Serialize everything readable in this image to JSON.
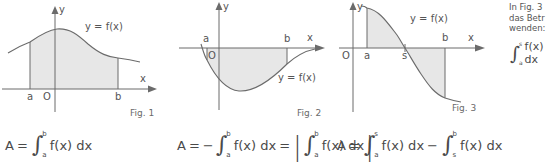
{
  "figures": [
    {
      "id": "fig1",
      "caption": "Fig. 1",
      "curve_label": "y = f(x)",
      "axis_x": "x",
      "axis_y": "y",
      "origin": "O",
      "lower_bound": "a",
      "upper_bound": "b",
      "fill_color": "#e7e7e7",
      "line_color": "#6b6b6b"
    },
    {
      "id": "fig2",
      "caption": "Fig. 2",
      "curve_label": "y = f(x)",
      "axis_x": "x",
      "axis_y": "y",
      "origin": "O",
      "lower_bound": "a",
      "upper_bound": "b",
      "fill_color": "#e7e7e7",
      "line_color": "#6b6b6b"
    },
    {
      "id": "fig3",
      "caption": "Fig. 3",
      "curve_label": "y = f(x)",
      "axis_x": "x",
      "axis_y": "y",
      "origin": "O",
      "lower_bound": "a",
      "zero_point": "s",
      "upper_bound": "b",
      "fill_color": "#e7e7e7",
      "line_color": "#6b6b6b"
    }
  ],
  "formulas": {
    "fig1": {
      "lhs": "A",
      "equals": "=",
      "integral_upper": "b",
      "integral_lower": "a",
      "integrand": "f(x) dx"
    },
    "fig2": {
      "lhs": "A",
      "equals": "=",
      "minus": "−",
      "integral_upper": "b",
      "integral_lower": "a",
      "integrand": "f(x) dx",
      "equals2": "=",
      "abs_integral_upper": "b",
      "abs_integral_lower": "a",
      "abs_integrand": "f(x) dx"
    },
    "fig3": {
      "lhs": "A",
      "equals": "=",
      "first_upper": "s",
      "first_lower": "a",
      "first_integrand": "f(x) dx",
      "minus": "−",
      "second_upper": "b",
      "second_lower": "s",
      "second_integrand": "f(x) dx"
    }
  },
  "side_note": {
    "line1": "In Fig. 3",
    "line2": "das Betr",
    "line3": "wenden:",
    "integral_upper": "s",
    "integral_lower": "a",
    "integrand": "f(x) dx"
  }
}
